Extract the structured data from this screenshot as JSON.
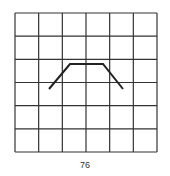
{
  "grid": {
    "rows": 6,
    "cols": 6,
    "left": 15,
    "top": 13,
    "right": 157,
    "bottom": 152,
    "line_color": "#333333"
  },
  "shape": {
    "points": [
      [
        49,
        89
      ],
      [
        70,
        64
      ],
      [
        103,
        64
      ],
      [
        123,
        89
      ]
    ],
    "stroke_color": "#222222",
    "stroke_width": 2
  },
  "caption": {
    "label": "76"
  }
}
